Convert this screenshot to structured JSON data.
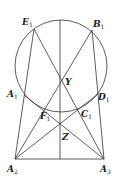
{
  "figure": {
    "type": "geometry-diagram",
    "circle": {
      "cx": 61,
      "cy": 66,
      "r": 46
    },
    "points": [
      {
        "name": "E",
        "sub": "1",
        "x": 34,
        "y": 29,
        "lx": 22,
        "ly": 25
      },
      {
        "name": "B",
        "sub": "1",
        "x": 92,
        "y": 30,
        "lx": 93,
        "ly": 27
      },
      {
        "name": "Y",
        "sub": "",
        "x": 61,
        "y": 81,
        "lx": 65,
        "ly": 85
      },
      {
        "name": "A",
        "sub": "1",
        "x": 24,
        "y": 95,
        "lx": 7,
        "ly": 97
      },
      {
        "name": "D",
        "sub": "1",
        "x": 98,
        "y": 94,
        "lx": 98,
        "ly": 100
      },
      {
        "name": "F",
        "sub": "1",
        "x": 44,
        "y": 108,
        "lx": 40,
        "ly": 119
      },
      {
        "name": "C",
        "sub": "1",
        "x": 78,
        "y": 107,
        "lx": 81,
        "ly": 117
      },
      {
        "name": "Z",
        "sub": "",
        "x": 61,
        "y": 123,
        "lx": 62,
        "ly": 140
      },
      {
        "name": "A",
        "sub": "2",
        "x": 15,
        "y": 159,
        "lx": 7,
        "ly": 172
      },
      {
        "name": "A",
        "sub": "3",
        "x": 104,
        "y": 159,
        "lx": 100,
        "ly": 172
      }
    ],
    "segments": [
      [
        "E1",
        "A3"
      ],
      [
        "B1",
        "A2"
      ],
      [
        "A1",
        "A3"
      ],
      [
        "D1",
        "A2"
      ],
      [
        "A2",
        "E1"
      ],
      [
        "A3",
        "B1"
      ],
      [
        "A2",
        "A3"
      ],
      [
        "TOP",
        "BOTTOM"
      ]
    ]
  }
}
